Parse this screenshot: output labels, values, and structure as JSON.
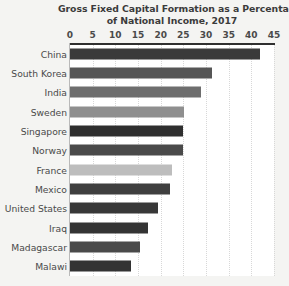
{
  "chart_data": {
    "type": "bar",
    "orientation": "horizontal",
    "title": "Gross Fixed Capital Formation as a Percentage of National Income, 2017",
    "title_lines": [
      "Gross Fixed Capital Formation as a Percentage",
      "of National Income, 2017"
    ],
    "xlabel": "",
    "ylabel": "",
    "xlim": [
      0,
      45
    ],
    "xticks": [
      0,
      5,
      10,
      15,
      20,
      25,
      30,
      35,
      40,
      45
    ],
    "xtick_labels": [
      "0",
      "5",
      "10",
      "15",
      "20",
      "25",
      "30",
      "35",
      "40",
      "45"
    ],
    "grid": true,
    "grid_axis": "x",
    "grid_style": "dotted",
    "legend": false,
    "axis_label_position": "top",
    "categories": [
      "China",
      "South Korea",
      "India",
      "Sweden",
      "Singapore",
      "Norway",
      "France",
      "Mexico",
      "United States",
      "Iraq",
      "Madagascar",
      "Malawi"
    ],
    "values": [
      42,
      31.3,
      28.8,
      25.1,
      25,
      24.9,
      22.6,
      22,
      19.5,
      17.2,
      15.5,
      13.5
    ],
    "bar_colors": [
      "#3a3a3a",
      "#565656",
      "#6e6e6e",
      "#8f8f8f",
      "#2f2f2f",
      "#4a4a4a",
      "#bdbdbd",
      "#3f3f3f",
      "#383838",
      "#343434",
      "#4a4a4a",
      "#333333"
    ],
    "bars": [
      {
        "label": "China",
        "value": 42,
        "color": "#3a3a3a"
      },
      {
        "label": "South Korea",
        "value": 31.3,
        "color": "#565656"
      },
      {
        "label": "India",
        "value": 28.8,
        "color": "#6e6e6e"
      },
      {
        "label": "Sweden",
        "value": 25.1,
        "color": "#8f8f8f"
      },
      {
        "label": "Singapore",
        "value": 25,
        "color": "#2f2f2f"
      },
      {
        "label": "Norway",
        "value": 24.9,
        "color": "#4a4a4a"
      },
      {
        "label": "France",
        "value": 22.6,
        "color": "#bdbdbd"
      },
      {
        "label": "Mexico",
        "value": 22,
        "color": "#3f3f3f"
      },
      {
        "label": "United States",
        "value": 19.5,
        "color": "#383838"
      },
      {
        "label": "Iraq",
        "value": 17.2,
        "color": "#343434"
      },
      {
        "label": "Madagascar",
        "value": 15.5,
        "color": "#4a4a4a"
      },
      {
        "label": "Malawi",
        "value": 13.5,
        "color": "#333333"
      }
    ]
  },
  "colors": {
    "page_background": "#f4f4f2",
    "plot_background": "#ffffff",
    "axis_line": "#2f2f2f",
    "baseline": "#b9b9b9",
    "gridline": "#d8d8d8",
    "title_text": "#3b3b3b",
    "tick_text": "#4a4a4a",
    "label_text": "#4a4a4a"
  }
}
